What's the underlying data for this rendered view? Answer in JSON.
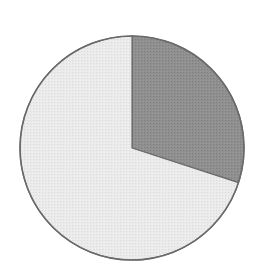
{
  "chart_data": {
    "type": "pie",
    "title": "",
    "categories": [
      "Slice A",
      "Slice B"
    ],
    "values": [
      30,
      70
    ],
    "colors": [
      "#8f8f8f",
      "#e9e9e9"
    ],
    "start_angle_deg": 0,
    "direction": "clockwise",
    "outline_color": "#6a6a6a",
    "legend": "none",
    "labels_visible": false
  },
  "layout": {
    "cx": 132,
    "cy": 148,
    "r": 112
  }
}
